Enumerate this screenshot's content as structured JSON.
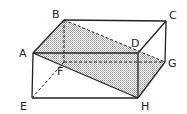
{
  "diagram": {
    "type": "cuboid-with-plane-section",
    "vertices": {
      "A": {
        "label": "A",
        "x": 33,
        "y": 53
      },
      "B": {
        "label": "B",
        "x": 64,
        "y": 20
      },
      "C": {
        "label": "C",
        "x": 166,
        "y": 21
      },
      "D": {
        "label": "D",
        "x": 138,
        "y": 53
      },
      "E": {
        "label": "E",
        "x": 32,
        "y": 98
      },
      "F": {
        "label": "F",
        "x": 64,
        "y": 62
      },
      "G": {
        "label": "G",
        "x": 165,
        "y": 62
      },
      "H": {
        "label": "H",
        "x": 138,
        "y": 98
      }
    },
    "shaded_plane": "ABGH",
    "solid_edges": [
      "AB",
      "BC",
      "CD",
      "DA",
      "AE",
      "EH",
      "DH",
      "CG",
      "GH",
      "AH"
    ],
    "dashed_edges": [
      "BF",
      "EF",
      "FG",
      "BG"
    ],
    "colors": {
      "line": "#222222",
      "shade": "#c8c8c8"
    }
  }
}
